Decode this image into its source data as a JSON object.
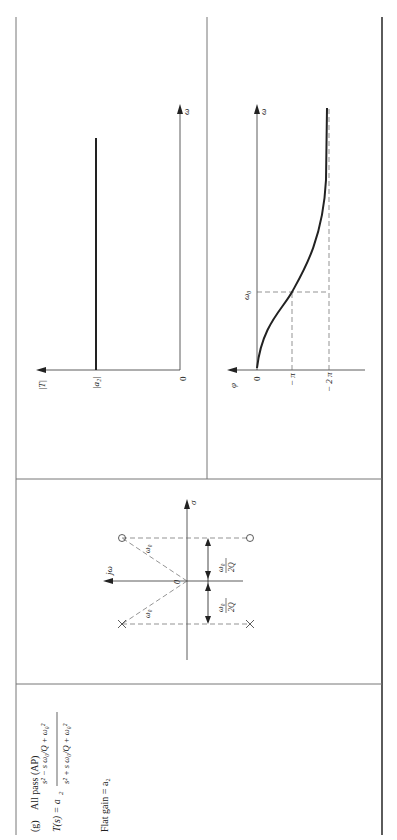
{
  "panel": {
    "label": "(g)",
    "title": "All pass (AP)",
    "transfer_function": {
      "lhs": "T(s) = a",
      "lhs_sub": "2",
      "numerator": "s² − s ω₀/Q + ω₀²",
      "denominator": "s² + s ω₀/Q + ω₀²"
    },
    "flat_gain": "Flat gain = a₂"
  },
  "pole_zero": {
    "axis_imag": "jω",
    "axis_real": "σ",
    "origin": "0",
    "radius_label": "ω₀",
    "offset_num": "ω₀",
    "offset_den": "2Q"
  },
  "magnitude_plot": {
    "y_axis": "|T|",
    "x_axis": "ω",
    "origin": "0",
    "level": "|a₂|"
  },
  "phase_plot": {
    "y_axis": "φ",
    "x_axis": "ω",
    "ticks": [
      "0",
      "− π",
      "− 2 π"
    ],
    "w0": "ω₀"
  },
  "colors": {
    "line": "#222222",
    "border": "#777777",
    "dash": "#666666"
  }
}
